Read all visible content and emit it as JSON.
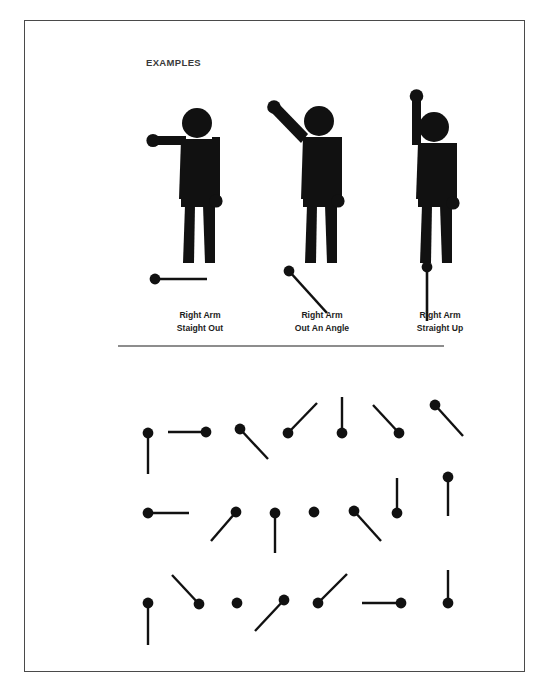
{
  "page": {
    "heading": "EXAMPLES",
    "ink_color": "#111111",
    "border_color": "#4a4a4a",
    "divider_color": "#8d8d8d",
    "background_color": "#ffffff"
  },
  "examples": [
    {
      "name": "right-arm-straight-out",
      "caption_line1": "Right Arm",
      "caption_line2": "Staight Out",
      "arm_direction": "horizontal-left",
      "sample_line": {
        "dot_x": 30,
        "dot_y": 198,
        "end_x": 82,
        "end_y": 198
      }
    },
    {
      "name": "right-arm-out-an-angle",
      "caption_line1": "Right Arm",
      "caption_line2": "Out  An Angle",
      "arm_direction": "diagonal-up-left",
      "sample_line": {
        "dot_x": 42,
        "dot_y": 190,
        "end_x": 80,
        "end_y": 232
      }
    },
    {
      "name": "right-arm-straight-up",
      "caption_line1": "Right Arm",
      "caption_line2": "Straight Up",
      "arm_direction": "vertical-up",
      "sample_line": {
        "dot_x": 62,
        "dot_y": 186,
        "end_x": 62,
        "end_y": 240
      }
    }
  ],
  "practice_grid": {
    "rows": 3,
    "items_per_row": 7,
    "dot_radius": 5.4,
    "stroke_width": 2.4,
    "items": [
      {
        "id": "r1c1",
        "dot_x": 123,
        "dot_y": 62,
        "end_x": 123,
        "end_y": 103,
        "direction": "down"
      },
      {
        "id": "r1c2",
        "dot_x": 181,
        "dot_y": 61,
        "end_x": 143,
        "end_y": 61,
        "direction": "left"
      },
      {
        "id": "r1c3",
        "dot_x": 215,
        "dot_y": 58,
        "end_x": 243,
        "end_y": 88,
        "direction": "down-right"
      },
      {
        "id": "r1c4",
        "dot_x": 263,
        "dot_y": 62,
        "end_x": 292,
        "end_y": 32,
        "direction": "up-right"
      },
      {
        "id": "r1c5",
        "dot_x": 317,
        "dot_y": 62,
        "end_x": 317,
        "end_y": 26,
        "direction": "up"
      },
      {
        "id": "r1c6",
        "dot_x": 374,
        "dot_y": 62,
        "end_x": 348,
        "end_y": 34,
        "direction": "up-left"
      },
      {
        "id": "r1c7",
        "dot_x": 410,
        "dot_y": 34,
        "end_x": 438,
        "end_y": 65,
        "direction": "down-right"
      },
      {
        "id": "r2c1",
        "dot_x": 123,
        "dot_y": 142,
        "end_x": 164,
        "end_y": 142,
        "direction": "right"
      },
      {
        "id": "r2c2",
        "dot_x": 211,
        "dot_y": 141,
        "end_x": 186,
        "end_y": 170,
        "direction": "down-left"
      },
      {
        "id": "r2c3",
        "dot_x": 250,
        "dot_y": 142,
        "end_x": 250,
        "end_y": 182,
        "direction": "down"
      },
      {
        "id": "r2c4",
        "dot_x": 289,
        "dot_y": 141,
        "end_x": 289,
        "end_y": 141,
        "direction": "none"
      },
      {
        "id": "r2c5",
        "dot_x": 329,
        "dot_y": 140,
        "end_x": 356,
        "end_y": 170,
        "direction": "down-right"
      },
      {
        "id": "r2c6",
        "dot_x": 372,
        "dot_y": 142,
        "end_x": 372,
        "end_y": 107,
        "direction": "up"
      },
      {
        "id": "r2c7",
        "dot_x": 423,
        "dot_y": 106,
        "end_x": 423,
        "end_y": 145,
        "direction": "down"
      },
      {
        "id": "r3c1",
        "dot_x": 123,
        "dot_y": 232,
        "end_x": 123,
        "end_y": 274,
        "direction": "down"
      },
      {
        "id": "r3c2",
        "dot_x": 174,
        "dot_y": 233,
        "end_x": 147,
        "end_y": 204,
        "direction": "up-left"
      },
      {
        "id": "r3c3",
        "dot_x": 212,
        "dot_y": 232,
        "end_x": 212,
        "end_y": 232,
        "direction": "none"
      },
      {
        "id": "r3c4",
        "dot_x": 259,
        "dot_y": 229,
        "end_x": 230,
        "end_y": 260,
        "direction": "down-left"
      },
      {
        "id": "r3c5",
        "dot_x": 293,
        "dot_y": 232,
        "end_x": 322,
        "end_y": 203,
        "direction": "up-right"
      },
      {
        "id": "r3c6",
        "dot_x": 376,
        "dot_y": 232,
        "end_x": 337,
        "end_y": 232,
        "direction": "left"
      },
      {
        "id": "r3c7",
        "dot_x": 423,
        "dot_y": 232,
        "end_x": 423,
        "end_y": 199,
        "direction": "up"
      }
    ]
  }
}
